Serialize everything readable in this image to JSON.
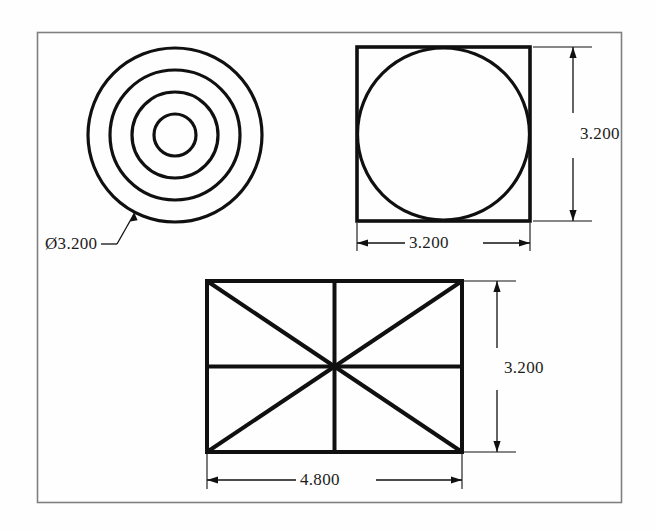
{
  "sheet": {
    "title": "Multiview orthographic drawing sheet",
    "background_color": "#fefefe",
    "line_color": "#101010",
    "frame": {
      "label": "drawing-border",
      "x": 37,
      "y": 32,
      "width": 585,
      "height": 471,
      "stroke_color": "#7a7a7a",
      "stroke_width": 1.5
    }
  },
  "views": [
    {
      "name": "concentric-circles-view",
      "type": "front-view",
      "center_x": 175,
      "center_y": 135,
      "circle_radii": [
        87,
        65,
        43,
        21
      ],
      "dimension": {
        "label": "Ø3.200",
        "value": 3.2,
        "symbol": "diameter",
        "leader": true
      }
    },
    {
      "name": "square-with-inscribed-circle-view",
      "type": "top-view",
      "x": 357,
      "y": 47,
      "width": 173,
      "height": 174,
      "inscribed_circle_radius": 86,
      "dimensions": {
        "width_label": "3.200",
        "height_label": "3.200",
        "width_value": 3.2,
        "height_value": 3.2
      }
    },
    {
      "name": "rectangle-with-diagonals-view",
      "type": "side-view",
      "x": 207,
      "y": 281,
      "width": 255,
      "height": 171,
      "has_diagonals": true,
      "has_centerlines": true,
      "dimensions": {
        "width_label": "4.800",
        "height_label": "3.200",
        "width_value": 4.8,
        "height_value": 3.2
      }
    }
  ],
  "labels": {
    "circle_diameter": "Ø3.200",
    "square_width": "3.200",
    "square_height": "3.200",
    "rectangle_width": "4.800",
    "rectangle_height": "3.200"
  }
}
